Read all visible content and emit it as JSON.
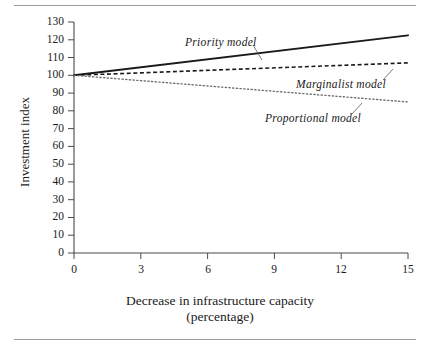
{
  "chart_data": {
    "type": "line",
    "title": "",
    "xlabel": "Decrease in infrastructure capacity (percentage)",
    "xlabel_line1": "Decrease in infrastructure capacity",
    "xlabel_line2": "(percentage)",
    "ylabel": "Investment index",
    "xlim": [
      0,
      15
    ],
    "ylim": [
      0,
      130
    ],
    "xticks": [
      0,
      3,
      6,
      9,
      12,
      15
    ],
    "yticks": [
      0,
      10,
      20,
      30,
      40,
      50,
      60,
      70,
      80,
      90,
      100,
      110,
      120,
      130
    ],
    "grid": false,
    "legend_position": "inline-annotations",
    "x": [
      0,
      15
    ],
    "series": [
      {
        "name": "Priority model",
        "style": "solid",
        "color": "#1a1a1a",
        "values": [
          100,
          122.5
        ],
        "annotation": "Priority model"
      },
      {
        "name": "Marginalist model",
        "style": "dashed",
        "color": "#1a1a1a",
        "values": [
          100,
          107
        ],
        "annotation": "Marginalist model"
      },
      {
        "name": "Proportional model",
        "style": "dotted",
        "color": "#6e6e6e",
        "values": [
          100,
          85
        ],
        "annotation": "Proportional model"
      }
    ],
    "annotations": [
      {
        "text": "Priority model",
        "series": "Priority model"
      },
      {
        "text": "Marginalist model",
        "series": "Marginalist model"
      },
      {
        "text": "Proportional model",
        "series": "Proportional model"
      }
    ]
  },
  "axis": {
    "y_tick_labels": [
      "130",
      "120",
      "110",
      "100",
      "90",
      "80",
      "70",
      "60",
      "50",
      "40",
      "30",
      "20",
      "10",
      "0"
    ],
    "x_tick_labels": [
      "0",
      "3",
      "6",
      "9",
      "12",
      "15"
    ]
  },
  "colors": {
    "axis": "#4a4a4a",
    "ink": "#1a1a1a",
    "rule": "#9a9a9a",
    "dotted": "#6e6e6e"
  }
}
